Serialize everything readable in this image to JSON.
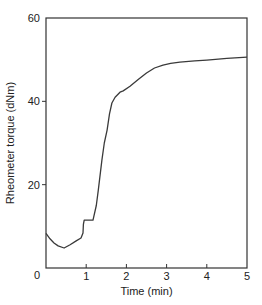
{
  "chart_data": {
    "type": "line",
    "title": "",
    "xlabel": "Time (min)",
    "ylabel": "Rheometer torque (dNm)",
    "xlim": [
      0,
      5
    ],
    "ylim": [
      0,
      60
    ],
    "xticks": [
      0,
      1,
      2,
      3,
      4,
      5
    ],
    "yticks": [
      0,
      20,
      40,
      60
    ],
    "grid": false,
    "legend": null,
    "series": [
      {
        "name": "Rheometer torque",
        "color": "#3a3a3a",
        "x": [
          0,
          0.1,
          0.2,
          0.3,
          0.45,
          0.6,
          0.75,
          0.87,
          0.92,
          0.93,
          0.95,
          1.17,
          1.25,
          1.3,
          1.39,
          1.45,
          1.52,
          1.58,
          1.64,
          1.72,
          1.84,
          1.92,
          2.09,
          2.3,
          2.5,
          2.7,
          2.91,
          3.1,
          3.33,
          3.7,
          4.0,
          4.5,
          5.0
        ],
        "y": [
          8.3,
          7.0,
          6.0,
          5.3,
          4.8,
          5.6,
          6.5,
          7.2,
          8.4,
          10.5,
          11.5,
          11.5,
          15.0,
          18.7,
          25.9,
          30.0,
          33.1,
          37.0,
          39.6,
          41.0,
          42.2,
          42.5,
          43.6,
          45.3,
          46.8,
          48.0,
          48.7,
          49.1,
          49.4,
          49.7,
          49.9,
          50.3,
          50.6
        ]
      }
    ]
  }
}
